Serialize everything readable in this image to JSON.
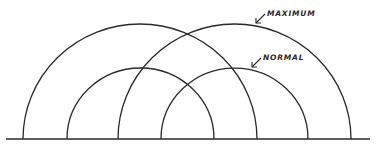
{
  "diagram": {
    "labels": {
      "maximum": "MAXIMUM",
      "normal": "NORMAL"
    },
    "baseline": {
      "x1": 6,
      "x2": 370,
      "y": 139
    },
    "arcs": [
      {
        "id": "maximum-left",
        "type": "maximum",
        "cx": 140,
        "r": 117
      },
      {
        "id": "maximum-right",
        "type": "maximum",
        "cx": 234.5,
        "r": 116.5
      },
      {
        "id": "normal-left",
        "type": "normal",
        "cx": 140.5,
        "r": 73.5
      },
      {
        "id": "normal-right",
        "type": "normal",
        "cx": 234.5,
        "r": 73.5
      }
    ],
    "colors": {
      "stroke": "#2a2a2a",
      "background": "#ffffff"
    }
  }
}
